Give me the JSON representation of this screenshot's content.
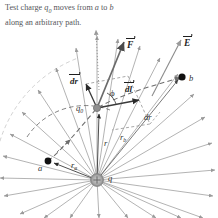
{
  "caption": {
    "line1_pre": "Test charge ",
    "line1_sym": "q",
    "line1_symsub": "0",
    "line1_mid": " moves from ",
    "line1_a": "a",
    "line1_to": " to ",
    "line1_b": "b",
    "line2": "along an arbitrary path."
  },
  "colors": {
    "field_line": "#9a9a9a",
    "dashed_path": "#6e6e6e",
    "solid_vector": "#555555",
    "point_marker": "#111111",
    "source_charge": "#9a9a9a",
    "text": "#2f2f2f",
    "caption_text": "#55565a",
    "background": "#ffffff"
  },
  "labels": {
    "point_a": "a",
    "point_b": "b",
    "source_charge": "q",
    "test_charge": "q",
    "test_charge_sub": "0",
    "force_vector": "F",
    "field_vector": "E",
    "dr_vector": "dr",
    "dl_vector": "dl",
    "dr_scalar": "dr",
    "r_distance": "r",
    "ra_distance": "r",
    "ra_sub": "a",
    "rb_distance": "r",
    "rb_sub": "b",
    "angle_phi": "ϕ"
  },
  "geometry": {
    "source_charge_xy": [
      97,
      180
    ],
    "test_charge_xy": [
      97,
      108
    ],
    "point_a_xy": [
      48,
      161
    ],
    "point_b_xy": [
      182,
      77
    ],
    "source_charge_radius": 6,
    "field_line_count": 24,
    "field_line_length": 120
  },
  "elements": {
    "diagram_name": "electric-field-work-diagram",
    "dotted_arrow": "vertical-dotted-reference-arrow",
    "arc_ra": "equipotential-arc-through-a",
    "arc_rb": "equipotential-arc-through-b",
    "path_curve": "arbitrary-path-a-to-b"
  }
}
